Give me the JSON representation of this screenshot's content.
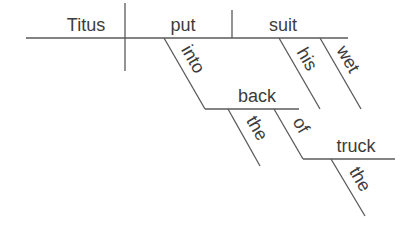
{
  "diagram": {
    "type": "sentence-diagram",
    "sentence_words": {
      "subject": "Titus",
      "verb": "put",
      "object": "suit",
      "object_modifier_1": "his",
      "object_modifier_2": "wet",
      "preposition_1": "into",
      "prep_object_1": "back",
      "prep_object_1_modifier": "the",
      "preposition_2": "of",
      "prep_object_2": "truck",
      "prep_object_2_modifier": "the"
    },
    "colors": {
      "line": "#5a5a5a",
      "text": "#3c3c3c",
      "background": "#ffffff"
    }
  }
}
